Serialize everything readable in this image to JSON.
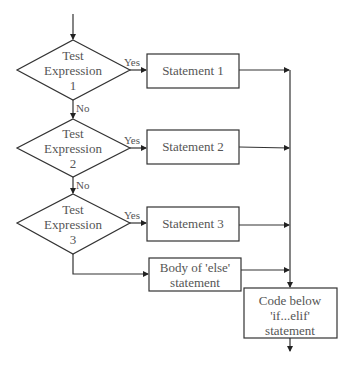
{
  "diagram": {
    "type": "flowchart",
    "colors": {
      "stroke": "#333333",
      "text": "#555555",
      "background": "#ffffff"
    },
    "decisions": [
      {
        "line1": "Test",
        "line2": "Expression",
        "line3": "1",
        "yes_label": "Yes",
        "no_label": "No"
      },
      {
        "line1": "Test",
        "line2": "Expression",
        "line3": "2",
        "yes_label": "Yes",
        "no_label": "No"
      },
      {
        "line1": "Test",
        "line2": "Expression",
        "line3": "3",
        "yes_label": "Yes"
      }
    ],
    "statements": [
      {
        "label": "Statement 1"
      },
      {
        "label": "Statement 2"
      },
      {
        "label": "Statement 3"
      }
    ],
    "else_box": {
      "line1": "Body of 'else'",
      "line2": "statement"
    },
    "final_box": {
      "line1": "Code below",
      "line2": "'if...elif'",
      "line3": "statement"
    }
  }
}
